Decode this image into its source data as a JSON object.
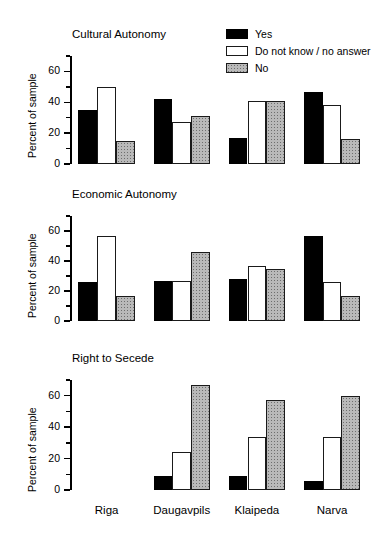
{
  "figure": {
    "ylabel": "Percent of sample",
    "categories": [
      "Riga",
      "Daugavpils",
      "Klaipeda",
      "Narva"
    ],
    "tick_labels": [
      "0",
      "20",
      "40",
      "60"
    ],
    "tick_values": [
      0,
      20,
      40,
      60
    ],
    "minor_tick_values": [
      10,
      30,
      50,
      70
    ],
    "ylim": [
      0,
      70
    ]
  },
  "legend": {
    "position": "top-right",
    "items": [
      {
        "label": "Yes",
        "key": "yes-swatch",
        "color": "#000000"
      },
      {
        "label": "Do not know / no answer",
        "key": "dk-swatch",
        "color": "#ffffff"
      },
      {
        "label": "No",
        "key": "no-swatch",
        "color": "#b9b9b9"
      }
    ]
  },
  "chart_data": [
    {
      "type": "bar",
      "title": "Cultural Autonomy",
      "xlabel": "",
      "ylabel": "Percent of sample",
      "ylim": [
        0,
        70
      ],
      "grid": false,
      "legend_position": "top-right",
      "categories": [
        "Riga",
        "Daugavpils",
        "Klaipeda",
        "Narva"
      ],
      "series": [
        {
          "name": "Yes",
          "values": [
            35,
            42,
            17,
            47
          ]
        },
        {
          "name": "Do not know / no answer",
          "values": [
            50,
            27,
            41,
            38
          ]
        },
        {
          "name": "No",
          "values": [
            15,
            31,
            41,
            16
          ]
        }
      ]
    },
    {
      "type": "bar",
      "title": "Economic Autonomy",
      "xlabel": "",
      "ylabel": "Percent of sample",
      "ylim": [
        0,
        70
      ],
      "grid": false,
      "legend_position": "none",
      "categories": [
        "Riga",
        "Daugavpils",
        "Klaipeda",
        "Narva"
      ],
      "series": [
        {
          "name": "Yes",
          "values": [
            26,
            27,
            28,
            57
          ]
        },
        {
          "name": "Do not know / no answer",
          "values": [
            57,
            27,
            37,
            26
          ]
        },
        {
          "name": "No",
          "values": [
            17,
            46,
            35,
            17
          ]
        }
      ]
    },
    {
      "type": "bar",
      "title": "Right to Secede",
      "xlabel": "",
      "ylabel": "Percent of sample",
      "ylim": [
        0,
        70
      ],
      "grid": false,
      "legend_position": "none",
      "categories": [
        "Riga",
        "Daugavpils",
        "Klaipeda",
        "Narva"
      ],
      "series": [
        {
          "name": "Yes",
          "values": [
            null,
            9,
            9,
            6
          ]
        },
        {
          "name": "Do not know / no answer",
          "values": [
            null,
            24,
            34,
            34
          ]
        },
        {
          "name": "No",
          "values": [
            null,
            67,
            57,
            60
          ]
        }
      ]
    }
  ]
}
